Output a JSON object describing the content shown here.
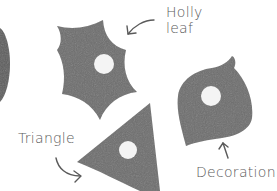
{
  "illustration": {
    "shape_color": "#6e6e6e",
    "hole_color": "#f4f4f4",
    "arrow_color": "#5a5a5a",
    "labels": {
      "holly_leaf_line1": "Holly",
      "holly_leaf_line2": "leaf",
      "triangle": "Triangle",
      "decoration": "Decoration"
    },
    "shapes": [
      {
        "name": "holly-leaf",
        "has_hole": true
      },
      {
        "name": "triangle",
        "has_hole": true
      },
      {
        "name": "decoration",
        "has_hole": true
      },
      {
        "name": "partial-pinecone",
        "has_hole": false
      }
    ]
  }
}
